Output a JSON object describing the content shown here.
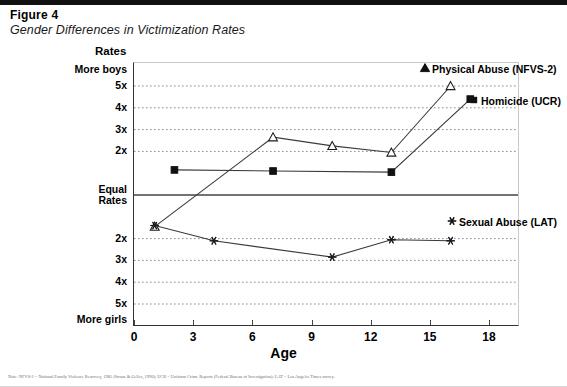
{
  "figure": {
    "number": "Figure 4",
    "title": "Gender Differences in Victimization Rates"
  },
  "axes": {
    "y_axis_title": "Rates",
    "y_top_label": "More boys",
    "y_bottom_label": "More girls",
    "y_center_label_line1": "Equal",
    "y_center_label_line2": "Rates",
    "y_ticks_upper": [
      "5x",
      "4x",
      "3x",
      "2x"
    ],
    "y_ticks_lower": [
      "2x",
      "3x",
      "4x",
      "5x"
    ],
    "x_axis_title": "Age",
    "x_ticks": [
      "0",
      "3",
      "6",
      "9",
      "12",
      "15",
      "18"
    ]
  },
  "annotations": {
    "physical_abuse": "Physical Abuse (NFVS-2)",
    "homicide": "Homicide (UCR)",
    "sexual_abuse": "Sexual Abuse (LAT)"
  },
  "footnote": "Note: NFVS-2 = National Family Violence Resurvey, 1985 (Straus & Gelles, 1990); UCR = Uniform Crime Reports (Federal Bureau of Investigation); LAT = Los Angeles Times survey.",
  "colors": {
    "line": "#3a3a3a",
    "grid": "#8a8a8a",
    "axis": "#333333",
    "text": "#000000"
  },
  "chart_data": {
    "type": "line",
    "title": "Gender Differences in Victimization Rates",
    "xlabel": "Age",
    "ylabel": "Rates",
    "xlim": [
      0,
      18
    ],
    "ylim": [
      -5.5,
      5.5
    ],
    "grid": true,
    "legend": "inline-labels",
    "y_axis_note": "Positive values = More boys (boys' rate N times girls'); negative values = More girls",
    "ytick_values": [
      5,
      4,
      3,
      2,
      1,
      -2,
      -3,
      -4,
      -5
    ],
    "ytick_labels": [
      "5x",
      "4x",
      "3x",
      "2x",
      "Equal Rates",
      "2x",
      "3x",
      "4x",
      "5x"
    ],
    "xtick_values": [
      0,
      3,
      6,
      9,
      12,
      15,
      18
    ],
    "series": [
      {
        "name": "Physical Abuse (NFVS-2)",
        "marker": "triangle",
        "points": [
          {
            "x": 1,
            "y": -1.45
          },
          {
            "x": 7,
            "y": 2.65
          },
          {
            "x": 10,
            "y": 2.25
          },
          {
            "x": 13,
            "y": 1.95
          },
          {
            "x": 16,
            "y": 5.0
          }
        ]
      },
      {
        "name": "Homicide (UCR)",
        "marker": "square",
        "points": [
          {
            "x": 2,
            "y": 1.15
          },
          {
            "x": 7,
            "y": 1.1
          },
          {
            "x": 13,
            "y": 1.05
          },
          {
            "x": 17,
            "y": 4.4
          }
        ]
      },
      {
        "name": "Sexual Abuse (LAT)",
        "marker": "asterisk",
        "points": [
          {
            "x": 1,
            "y": -1.4
          },
          {
            "x": 4,
            "y": -2.1
          },
          {
            "x": 10,
            "y": -2.85
          },
          {
            "x": 13,
            "y": -2.05
          },
          {
            "x": 16,
            "y": -2.1
          }
        ]
      }
    ]
  }
}
